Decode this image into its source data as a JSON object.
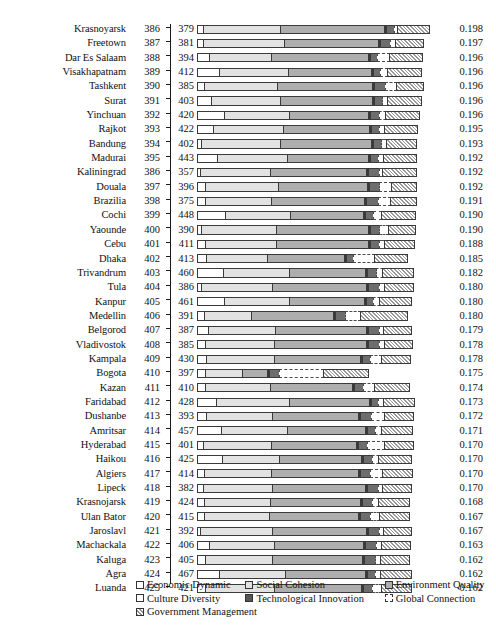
{
  "chart_data": {
    "type": "bar",
    "subtype": "stacked-horizontal-bar",
    "title": "",
    "xlabel": "",
    "ylabel": "",
    "grid": false,
    "legend_position": "bottom",
    "columns": [
      "City",
      "Rank",
      "Score",
      "Bar",
      "Value"
    ],
    "series": [
      {
        "name": "Economic Dynamic",
        "key": "economic",
        "color": "#ffffff",
        "pattern": "solid"
      },
      {
        "name": "Social Cohesion",
        "key": "social",
        "color": "#e2e2e2",
        "pattern": "solid"
      },
      {
        "name": "Environment Quality",
        "key": "environment",
        "color": "#aeaeae",
        "pattern": "solid"
      },
      {
        "name": "Culture Diversity",
        "key": "culture",
        "color": "#ffffff",
        "pattern": "solid"
      },
      {
        "name": "Technological Innovation",
        "key": "technological",
        "color": "#6d6d6d",
        "pattern": "solid"
      },
      {
        "name": "Global Connection",
        "key": "global",
        "color": "#ffffff",
        "pattern": "dashed-outline"
      },
      {
        "name": "Government Management",
        "key": "government",
        "color": "#9a9a9a",
        "pattern": "cross-hatch"
      }
    ],
    "rows": [
      {
        "city": "Krasnoyarsk",
        "rank": "386",
        "score": "379",
        "value": "0.198",
        "segments": [
          7,
          78,
          105,
          2,
          9,
          4,
          33
        ]
      },
      {
        "city": "Freetown",
        "rank": "387",
        "score": "381",
        "value": "0.197",
        "segments": [
          7,
          82,
          95,
          2,
          11,
          6,
          29
        ]
      },
      {
        "city": "Dar Es Salaam",
        "rank": "388",
        "score": "394",
        "value": "0.196",
        "segments": [
          13,
          63,
          98,
          2,
          8,
          13,
          34
        ]
      },
      {
        "city": "Visakhapatnam",
        "rank": "389",
        "score": "412",
        "value": "0.196",
        "segments": [
          23,
          70,
          84,
          2,
          8,
          8,
          35
        ]
      },
      {
        "city": "Tashkent",
        "rank": "390",
        "score": "385",
        "value": "0.196",
        "segments": [
          8,
          74,
          96,
          2,
          12,
          12,
          28
        ]
      },
      {
        "city": "Surat",
        "rank": "391",
        "score": "403",
        "value": "0.196",
        "segments": [
          15,
          70,
          93,
          2,
          9,
          6,
          35
        ]
      },
      {
        "city": "Yinchuan",
        "rank": "392",
        "score": "420",
        "value": "0.196",
        "segments": [
          28,
          66,
          80,
          2,
          10,
          7,
          35
        ]
      },
      {
        "city": "Rajkot",
        "rank": "393",
        "score": "422",
        "value": "0.195",
        "segments": [
          17,
          71,
          87,
          2,
          9,
          6,
          34
        ]
      },
      {
        "city": "Bandung",
        "rank": "394",
        "score": "402",
        "value": "0.193",
        "segments": [
          5,
          80,
          92,
          2,
          9,
          6,
          31
        ]
      },
      {
        "city": "Madurai",
        "rank": "395",
        "score": "443",
        "value": "0.192",
        "segments": [
          21,
          71,
          82,
          2,
          9,
          6,
          34
        ]
      },
      {
        "city": "Kaliningrad",
        "rank": "386",
        "score": "357",
        "value": "0.192",
        "segments": [
          4,
          71,
          97,
          2,
          12,
          4,
          35
        ]
      },
      {
        "city": "Douala",
        "rank": "397",
        "score": "396",
        "value": "0.192",
        "segments": [
          9,
          74,
          90,
          2,
          11,
          13,
          26
        ]
      },
      {
        "city": "Brazilia",
        "rank": "398",
        "score": "375",
        "value": "0.191",
        "segments": [
          9,
          67,
          94,
          2,
          13,
          13,
          27
        ]
      },
      {
        "city": "Cochi",
        "rank": "399",
        "score": "448",
        "value": "0.190",
        "segments": [
          29,
          66,
          74,
          2,
          9,
          9,
          35
        ]
      },
      {
        "city": "Yaounde",
        "rank": "400",
        "score": "390",
        "value": "0.190",
        "segments": [
          5,
          76,
          93,
          2,
          10,
          10,
          28
        ]
      },
      {
        "city": "Cebu",
        "rank": "401",
        "score": "411",
        "value": "0.188",
        "segments": [
          9,
          72,
          93,
          2,
          10,
          6,
          31
        ]
      },
      {
        "city": "Dhaka",
        "rank": "402",
        "score": "413",
        "value": "0.185",
        "segments": [
          10,
          62,
          78,
          2,
          8,
          22,
          34
        ]
      },
      {
        "city": "Trivandrum",
        "rank": "403",
        "score": "460",
        "value": "0.182",
        "segments": [
          27,
          67,
          77,
          2,
          10,
          7,
          32
        ]
      },
      {
        "city": "Tula",
        "rank": "404",
        "score": "386",
        "value": "0.180",
        "segments": [
          5,
          72,
          95,
          2,
          12,
          6,
          30
        ]
      },
      {
        "city": "Kanpur",
        "rank": "405",
        "score": "461",
        "value": "0.180",
        "segments": [
          28,
          66,
          76,
          2,
          8,
          7,
          33
        ]
      },
      {
        "city": "Medellin",
        "rank": "406",
        "score": "391",
        "value": "0.180",
        "segments": [
          8,
          48,
          83,
          2,
          11,
          16,
          48
        ]
      },
      {
        "city": "Belgorod",
        "rank": "407",
        "score": "387",
        "value": "0.179",
        "segments": [
          12,
          68,
          92,
          2,
          12,
          5,
          29
        ]
      },
      {
        "city": "Vladivostok",
        "rank": "408",
        "score": "385",
        "value": "0.178",
        "segments": [
          9,
          70,
          93,
          2,
          12,
          6,
          29
        ]
      },
      {
        "city": "Kampala",
        "rank": "409",
        "score": "430",
        "value": "0.178",
        "segments": [
          10,
          69,
          87,
          2,
          9,
          12,
          30
        ]
      },
      {
        "city": "Bogota",
        "rank": "410",
        "score": "397",
        "value": "0.175",
        "segments": [
          9,
          38,
          26,
          2,
          11,
          45,
          46
        ]
      },
      {
        "city": "Kazan",
        "rank": "411",
        "score": "410",
        "value": "0.174",
        "segments": [
          9,
          66,
          83,
          2,
          10,
          12,
          36
        ]
      },
      {
        "city": "Faridabad",
        "rank": "412",
        "score": "428",
        "value": "0.173",
        "segments": [
          20,
          74,
          81,
          2,
          8,
          6,
          32
        ]
      },
      {
        "city": "Dushanbe",
        "rank": "413",
        "score": "393",
        "value": "0.172",
        "segments": [
          10,
          67,
          87,
          2,
          12,
          14,
          30
        ]
      },
      {
        "city": "Amritsar",
        "rank": "414",
        "score": "457",
        "value": "0.171",
        "segments": [
          25,
          67,
          79,
          2,
          9,
          7,
          32
        ]
      },
      {
        "city": "Hyderabad",
        "rank": "415",
        "score": "401",
        "value": "0.170",
        "segments": [
          7,
          69,
          86,
          2,
          10,
          18,
          30
        ]
      },
      {
        "city": "Haikou",
        "rank": "416",
        "score": "425",
        "value": "0.170",
        "segments": [
          26,
          58,
          83,
          2,
          10,
          7,
          34
        ]
      },
      {
        "city": "Algiers",
        "rank": "417",
        "score": "414",
        "value": "0.170",
        "segments": [
          8,
          68,
          88,
          2,
          11,
          13,
          31
        ]
      },
      {
        "city": "Lipeck",
        "rank": "418",
        "score": "382",
        "value": "0.170",
        "segments": [
          7,
          70,
          94,
          2,
          12,
          5,
          30
        ]
      },
      {
        "city": "Krasnojarsk",
        "rank": "419",
        "score": "424",
        "value": "0.168",
        "segments": [
          8,
          67,
          91,
          2,
          11,
          7,
          32
        ]
      },
      {
        "city": "Ulan Bator",
        "rank": "420",
        "score": "415",
        "value": "0.167",
        "segments": [
          8,
          66,
          90,
          2,
          11,
          10,
          31
        ]
      },
      {
        "city": "Jaroslavl",
        "rank": "421",
        "score": "392",
        "value": "0.167",
        "segments": [
          4,
          73,
          95,
          2,
          12,
          5,
          29
        ]
      },
      {
        "city": "Machackala",
        "rank": "422",
        "score": "406",
        "value": "0.163",
        "segments": [
          13,
          66,
          90,
          2,
          12,
          6,
          30
        ]
      },
      {
        "city": "Kaluga",
        "rank": "423",
        "score": "405",
        "value": "0.162",
        "segments": [
          9,
          68,
          91,
          2,
          12,
          6,
          30
        ]
      },
      {
        "city": "Agra",
        "rank": "424",
        "score": "467",
        "value": "0.162",
        "segments": [
          23,
          67,
          81,
          2,
          9,
          6,
          32
        ]
      },
      {
        "city": "Luanda",
        "rank": "425",
        "score": "421",
        "value": "0.162",
        "segments": [
          9,
          70,
          88,
          2,
          10,
          10,
          31
        ]
      }
    ]
  },
  "legend": {
    "rows": [
      [
        {
          "label": "Economic Dynamic",
          "key": "economic"
        },
        {
          "label": "Social Cohesion",
          "key": "social"
        },
        {
          "label": "Environment Quality",
          "key": "environment"
        }
      ],
      [
        {
          "label": "Culture Diversity",
          "key": "culture"
        },
        {
          "label": "Technological Innovation",
          "key": "technological"
        },
        {
          "label": "Global Connection",
          "key": "global"
        }
      ],
      [
        {
          "label": "Government Management",
          "key": "government"
        }
      ]
    ]
  }
}
